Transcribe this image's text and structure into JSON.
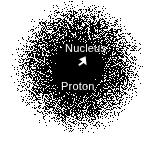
{
  "figure": {
    "background_color": "#ffffff",
    "cloud_color": "#000000",
    "label_color": "#ffffff",
    "width": 156,
    "height": 155
  },
  "labels": {
    "nucleus": "Nucleus",
    "proton": "Proton"
  },
  "annotations": {
    "arrow_name": "nucleus-pointer-arrow",
    "arrow_direction": "down-left"
  },
  "chart_data": {
    "type": "scatter",
    "xlabel": "",
    "ylabel": "",
    "grid": false,
    "legend": "none",
    "rendering": "stipple-dot-density",
    "center_x": 78,
    "center_y": 68,
    "core_radius": 17,
    "cloud_radius": 68,
    "point_count": 17000,
    "density_falloff": "gaussian",
    "sigma": 30,
    "dot_size": 1,
    "xlim": [
      0,
      156
    ],
    "ylim": [
      0,
      155
    ],
    "annotations": [
      {
        "text": "Nucleus",
        "x": 65,
        "y": 43,
        "color": "#ffffff"
      },
      {
        "text": "Proton",
        "x": 61,
        "y": 81,
        "color": "#ffffff"
      },
      {
        "text": "",
        "x": 82,
        "y": 62,
        "type": "arrow",
        "color": "#ffffff"
      }
    ]
  }
}
